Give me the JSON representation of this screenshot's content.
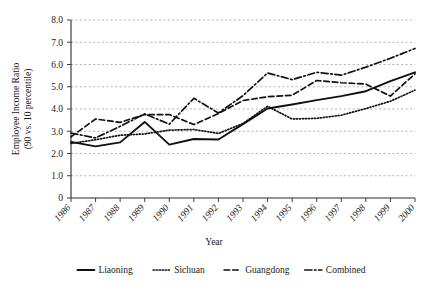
{
  "chart_data": {
    "type": "line",
    "title": "",
    "xlabel": "Year",
    "ylabel": "Employee Income Ratio\n(90 vs. 10 percentile)",
    "ylabel_line1": "Employee Income Ratio",
    "ylabel_line2": "(90 vs. 10 percentile)",
    "x": [
      1986,
      1987,
      1988,
      1989,
      1990,
      1991,
      1992,
      1993,
      1994,
      1995,
      1996,
      1997,
      1998,
      1999,
      2000
    ],
    "categories": [
      "1986",
      "1987",
      "1988",
      "1989",
      "1990",
      "1991",
      "1992",
      "1993",
      "1994",
      "1995",
      "1996",
      "1997",
      "1998",
      "1999",
      "2000"
    ],
    "xlim": [
      1986,
      2000
    ],
    "ylim": [
      0,
      8.0
    ],
    "ytick_labels": [
      "0",
      "1.0",
      "2.0",
      "3.0",
      "4.0",
      "5.0",
      "6.0",
      "7.0",
      "8.0"
    ],
    "ytick_values": [
      0,
      1.0,
      2.0,
      3.0,
      4.0,
      5.0,
      6.0,
      7.0,
      8.0
    ],
    "grid": true,
    "grid_axis": "y",
    "legend_position": "bottom",
    "series": [
      {
        "name": "Liaoning",
        "style": "solid",
        "values": [
          2.52,
          2.32,
          2.5,
          3.42,
          2.4,
          2.65,
          2.63,
          3.32,
          4.02,
          4.2,
          4.4,
          4.58,
          4.8,
          5.25,
          5.65
        ]
      },
      {
        "name": "Sichuan",
        "style": "dotted",
        "values": [
          2.45,
          2.62,
          2.82,
          2.88,
          3.05,
          3.08,
          2.9,
          3.35,
          4.12,
          3.55,
          3.58,
          3.72,
          4.02,
          4.35,
          4.85
        ]
      },
      {
        "name": "Guangdong",
        "style": "dashed",
        "values": [
          2.75,
          3.55,
          3.4,
          3.75,
          3.75,
          3.3,
          3.8,
          4.38,
          4.55,
          4.62,
          5.28,
          5.18,
          5.12,
          4.58,
          5.58
        ]
      },
      {
        "name": "Combined",
        "style": "dashdot",
        "values": [
          2.92,
          2.7,
          3.22,
          3.78,
          3.32,
          4.48,
          3.82,
          4.6,
          5.62,
          5.32,
          5.65,
          5.52,
          5.88,
          6.28,
          6.72
        ]
      }
    ]
  },
  "legend": {
    "items": [
      {
        "label": "Liaoning",
        "style": "solid"
      },
      {
        "label": "Sichuan",
        "style": "dotted"
      },
      {
        "label": "Guangdong",
        "style": "dashed"
      },
      {
        "label": "Combined",
        "style": "dashdot"
      }
    ]
  }
}
